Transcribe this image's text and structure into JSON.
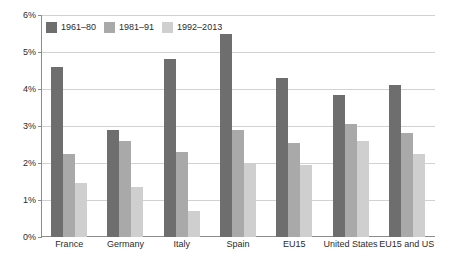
{
  "chart_data": {
    "type": "bar",
    "title": "",
    "subtitle": "",
    "xlabel": "",
    "ylabel": "",
    "ylim": [
      0,
      6
    ],
    "ytick_labels": [
      "0%",
      "1%",
      "2%",
      "3%",
      "4%",
      "5%",
      "6%"
    ],
    "ytick_values": [
      0,
      1,
      2,
      3,
      4,
      5,
      6
    ],
    "grid": true,
    "legend_position": "top-left",
    "categories": [
      "France",
      "Germany",
      "Italy",
      "Spain",
      "EU15",
      "United States",
      "EU15 and US"
    ],
    "series": [
      {
        "name": "1961–80",
        "color": "#6e6e6e",
        "values": [
          4.6,
          2.9,
          4.8,
          5.5,
          4.3,
          3.85,
          4.1
        ]
      },
      {
        "name": "1981–91",
        "color": "#a9a9a9",
        "values": [
          2.25,
          2.6,
          2.3,
          2.9,
          2.55,
          3.05,
          2.8
        ]
      },
      {
        "name": "1992–2013",
        "color": "#cfcfcf",
        "values": [
          1.45,
          1.35,
          0.7,
          2.0,
          1.95,
          2.6,
          2.25
        ]
      }
    ]
  },
  "colors": {
    "series_1": "#6e6e6e",
    "series_2": "#a9a9a9",
    "series_3": "#cfcfcf",
    "gridline": "#d2d2d2",
    "axis": "#8c8c8c",
    "text": "#2b2b2b",
    "background": "#ffffff"
  }
}
